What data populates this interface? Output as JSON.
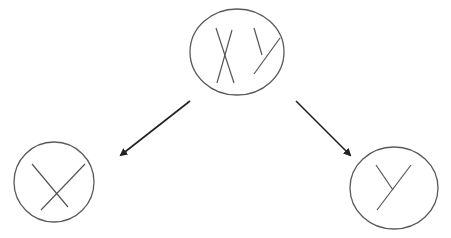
{
  "diagram": {
    "colors": {
      "outline": "#5a5a5a",
      "glyph": "#555555",
      "arrow": "#222222",
      "background": "#ffffff"
    },
    "nodes": [
      {
        "id": "parent",
        "label": "XY",
        "cx": 237,
        "cy": 52,
        "rx": 47,
        "ry": 43
      },
      {
        "id": "child-x",
        "label": "X",
        "cx": 54,
        "cy": 182,
        "rx": 40,
        "ry": 40
      },
      {
        "id": "child-y",
        "label": "Y",
        "cx": 394,
        "cy": 188,
        "rx": 44,
        "ry": 41
      }
    ],
    "edges": [
      {
        "from": "parent",
        "to": "child-x",
        "x1": 190,
        "y1": 101,
        "x2": 121,
        "y2": 155
      },
      {
        "from": "parent",
        "to": "child-y",
        "x1": 296,
        "y1": 101,
        "x2": 350,
        "y2": 155
      }
    ]
  }
}
